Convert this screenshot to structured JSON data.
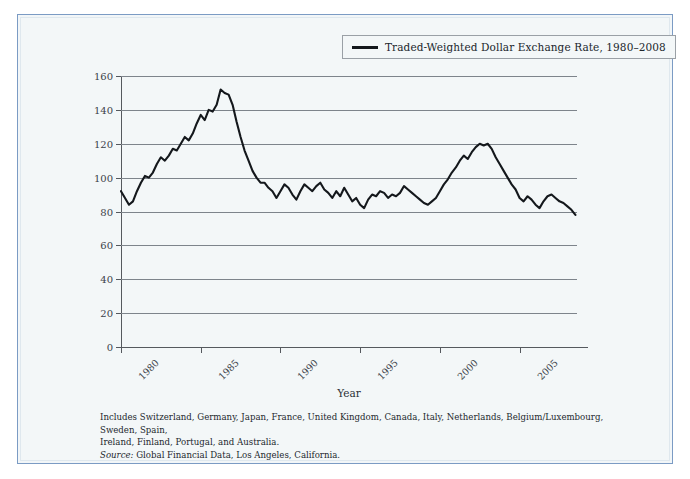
{
  "figure": {
    "legend": {
      "label": "Traded-Weighted Dollar Exchange Rate, 1980–2008",
      "swatch_name": "line-swatch",
      "swatch_color": "#14181c"
    },
    "axis_title_x": "Year",
    "footnote": {
      "line1": "Includes Switzerland, Germany, Japan, France, United Kingdom, Canada, Italy, Netherlands, Belgium/Luxembourg, Sweden, Spain,",
      "line2": "Ireland, Finland, Portugal, and Australia.",
      "source_label": "Source:",
      "source_text": " Global Financial Data, Los Angeles, California."
    },
    "colors": {
      "border": "#7b9bc4",
      "background": "#f3f7f8",
      "gridline": "#7d848b",
      "axis": "#55595e",
      "series": "#14181c"
    }
  },
  "chart_data": {
    "type": "line",
    "title": "Traded-Weighted Dollar Exchange Rate, 1980–2008",
    "xlabel": "Year",
    "ylabel": "",
    "xlim": [
      1980,
      2008.6
    ],
    "ylim": [
      0,
      160
    ],
    "grid": true,
    "legend_position": "top-right-outside",
    "yticks": [
      0,
      20,
      40,
      60,
      80,
      100,
      120,
      140,
      160
    ],
    "xticks": [
      1980,
      1985,
      1990,
      1995,
      2000,
      2005
    ],
    "series": [
      {
        "name": "Traded-Weighted Dollar Exchange Rate",
        "color": "#14181c",
        "x": [
          1980.0,
          1980.25,
          1980.5,
          1980.75,
          1981.0,
          1981.25,
          1981.5,
          1981.75,
          1982.0,
          1982.25,
          1982.5,
          1982.75,
          1983.0,
          1983.25,
          1983.5,
          1983.75,
          1984.0,
          1984.25,
          1984.5,
          1984.75,
          1985.0,
          1985.25,
          1985.5,
          1985.75,
          1986.0,
          1986.25,
          1986.5,
          1986.75,
          1987.0,
          1987.25,
          1987.5,
          1987.75,
          1988.0,
          1988.25,
          1988.5,
          1988.75,
          1989.0,
          1989.25,
          1989.5,
          1989.75,
          1990.0,
          1990.25,
          1990.5,
          1990.75,
          1991.0,
          1991.25,
          1991.5,
          1991.75,
          1992.0,
          1992.25,
          1992.5,
          1992.75,
          1993.0,
          1993.25,
          1993.5,
          1993.75,
          1994.0,
          1994.25,
          1994.5,
          1994.75,
          1995.0,
          1995.25,
          1995.5,
          1995.75,
          1996.0,
          1996.25,
          1996.5,
          1996.75,
          1997.0,
          1997.25,
          1997.5,
          1997.75,
          1998.0,
          1998.25,
          1998.5,
          1998.75,
          1999.0,
          1999.25,
          1999.5,
          1999.75,
          2000.0,
          2000.25,
          2000.5,
          2000.75,
          2001.0,
          2001.25,
          2001.5,
          2001.75,
          2002.0,
          2002.25,
          2002.5,
          2002.75,
          2003.0,
          2003.25,
          2003.5,
          2003.75,
          2004.0,
          2004.25,
          2004.5,
          2004.75,
          2005.0,
          2005.25,
          2005.5,
          2005.75,
          2006.0,
          2006.25,
          2006.5,
          2006.75,
          2007.0,
          2007.25,
          2007.5,
          2007.75,
          2008.0,
          2008.25,
          2008.5
        ],
        "y": [
          92,
          88,
          84,
          86,
          92,
          97,
          101,
          100,
          103,
          108,
          112,
          110,
          113,
          117,
          116,
          120,
          124,
          122,
          126,
          132,
          137,
          134,
          140,
          139,
          143,
          152,
          150,
          149,
          143,
          133,
          124,
          116,
          110,
          104,
          100,
          97,
          97,
          94,
          92,
          88,
          92,
          96,
          94,
          90,
          87,
          92,
          96,
          94,
          92,
          95,
          97,
          93,
          91,
          88,
          92,
          89,
          94,
          90,
          86,
          88,
          84,
          82,
          87,
          90,
          89,
          92,
          91,
          88,
          90,
          89,
          91,
          95,
          93,
          91,
          89,
          87,
          85,
          84,
          86,
          88,
          92,
          96,
          99,
          103,
          106,
          110,
          113,
          111,
          115,
          118,
          120,
          119,
          120,
          117,
          112,
          108,
          104,
          100,
          96,
          93,
          88,
          86,
          89,
          87,
          84,
          82,
          86,
          89,
          90,
          88,
          86,
          85,
          83,
          81,
          78
        ]
      }
    ]
  }
}
